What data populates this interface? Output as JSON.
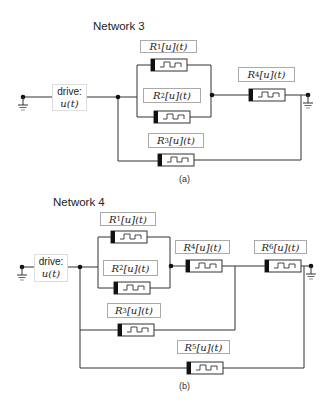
{
  "figure": {
    "panels": [
      {
        "id": "a",
        "title": "Network 3",
        "caption": "(a)",
        "drive": {
          "line1": "drive:",
          "line2": "u(t)"
        },
        "elements": [
          {
            "name": "R1",
            "base": "R",
            "sub": "1",
            "rest": "[u](t)"
          },
          {
            "name": "R2",
            "base": "R",
            "sub": "2",
            "rest": "[u](t)"
          },
          {
            "name": "R3",
            "base": "R",
            "sub": "3",
            "rest": "[u](t)"
          },
          {
            "name": "R4",
            "base": "R",
            "sub": "4",
            "rest": "[u](t)"
          }
        ]
      },
      {
        "id": "b",
        "title": "Network 4",
        "caption": "(b)",
        "drive": {
          "line1": "drive:",
          "line2": "u(t)"
        },
        "elements": [
          {
            "name": "R1",
            "base": "R",
            "sub": "1",
            "rest": "[u](t)"
          },
          {
            "name": "R2",
            "base": "R",
            "sub": "2",
            "rest": "[u](t)"
          },
          {
            "name": "R3",
            "base": "R",
            "sub": "3",
            "rest": "[u](t)"
          },
          {
            "name": "R4",
            "base": "R",
            "sub": "4",
            "rest": "[u](t)"
          },
          {
            "name": "R5",
            "base": "R",
            "sub": "5",
            "rest": "[u](t)"
          },
          {
            "name": "R6",
            "base": "R",
            "sub": "6",
            "rest": "[u](t)"
          }
        ]
      }
    ]
  },
  "colors": {
    "wire": "#333333",
    "label_border": "#aaaaaa",
    "memristor_band": "#111111"
  }
}
